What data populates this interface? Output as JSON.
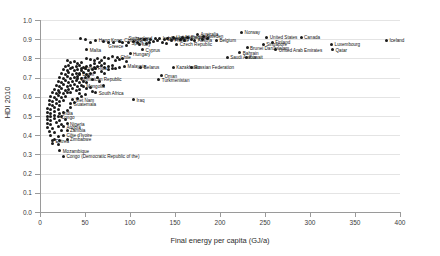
{
  "chart_data": {
    "type": "scatter",
    "title": "",
    "xlabel": "Final energy per capita (GJ/a)",
    "ylabel": "HDI 2010",
    "xlim": [
      0,
      400
    ],
    "ylim": [
      0.0,
      1.0
    ],
    "xticks": [
      "0",
      "50",
      "100",
      "150",
      "200",
      "250",
      "300",
      "350",
      "400"
    ],
    "yticks": [
      "0.0",
      "0.1",
      "0.2",
      "0.3",
      "0.4",
      "0.5",
      "0.6",
      "0.7",
      "0.8",
      "0.9",
      "1.0"
    ],
    "grid": "horizontal",
    "legend": "none",
    "marker_color": "#1a1a1a",
    "points": [
      {
        "label": "Iceland",
        "x": 385,
        "y": 0.895,
        "side": "right"
      },
      {
        "label": "Norway",
        "x": 224,
        "y": 0.935,
        "side": "right"
      },
      {
        "label": "Australia",
        "x": 175,
        "y": 0.925,
        "side": "right"
      },
      {
        "label": "United States",
        "x": 252,
        "y": 0.91,
        "side": "right"
      },
      {
        "label": "Canada",
        "x": 290,
        "y": 0.91,
        "side": "right"
      },
      {
        "label": "Luxembourg",
        "x": 324,
        "y": 0.875,
        "side": "right"
      },
      {
        "label": "Qatar",
        "x": 325,
        "y": 0.845,
        "side": "right"
      },
      {
        "label": "United Arab Emirates",
        "x": 262,
        "y": 0.845,
        "side": "right"
      },
      {
        "label": "Finland",
        "x": 258,
        "y": 0.885,
        "side": "right"
      },
      {
        "label": "Singapore",
        "x": 248,
        "y": 0.875,
        "side": "right"
      },
      {
        "label": "Brunei Darussalam",
        "x": 230,
        "y": 0.855,
        "side": "right"
      },
      {
        "label": "Bahrain",
        "x": 222,
        "y": 0.83,
        "side": "right"
      },
      {
        "label": "Saudi Arabia",
        "x": 208,
        "y": 0.805,
        "side": "right"
      },
      {
        "label": "Kuwait",
        "x": 229,
        "y": 0.805,
        "side": "right"
      },
      {
        "label": "Sweden",
        "x": 182,
        "y": 0.915,
        "side": "right"
      },
      {
        "label": "Belgium",
        "x": 196,
        "y": 0.895,
        "side": "right"
      },
      {
        "label": "Austria",
        "x": 172,
        "y": 0.895,
        "side": "right"
      },
      {
        "label": "United Kingdom",
        "x": 148,
        "y": 0.91,
        "side": "right"
      },
      {
        "label": "France",
        "x": 146,
        "y": 0.895,
        "side": "right"
      },
      {
        "label": "Czech Republic",
        "x": 152,
        "y": 0.875,
        "side": "right"
      },
      {
        "label": "Germany",
        "x": 142,
        "y": 0.905,
        "side": "right"
      },
      {
        "label": "Netherlands",
        "x": 158,
        "y": 0.91,
        "side": "right"
      },
      {
        "label": "Denmark",
        "x": 138,
        "y": 0.9,
        "side": "right"
      },
      {
        "label": "Ireland",
        "x": 133,
        "y": 0.905,
        "side": "right"
      },
      {
        "label": "Switzerland",
        "x": 128,
        "y": 0.905,
        "side": "left"
      },
      {
        "label": "Japan",
        "x": 123,
        "y": 0.9,
        "side": "left"
      },
      {
        "label": "Spain",
        "x": 118,
        "y": 0.88,
        "side": "left"
      },
      {
        "label": "Italy",
        "x": 110,
        "y": 0.875,
        "side": "right"
      },
      {
        "label": "Greece",
        "x": 96,
        "y": 0.865,
        "side": "left"
      },
      {
        "label": "Cyprus",
        "x": 114,
        "y": 0.845,
        "side": "right"
      },
      {
        "label": "Hungary",
        "x": 100,
        "y": 0.825,
        "side": "right"
      },
      {
        "label": "Chile",
        "x": 86,
        "y": 0.805,
        "side": "right"
      },
      {
        "label": "Hong Kong, China (SAR)",
        "x": 62,
        "y": 0.895,
        "side": "right"
      },
      {
        "label": "Malta",
        "x": 52,
        "y": 0.845,
        "side": "right"
      },
      {
        "label": "Malaysia",
        "x": 94,
        "y": 0.76,
        "side": "right"
      },
      {
        "label": "Belarus",
        "x": 112,
        "y": 0.755,
        "side": "right"
      },
      {
        "label": "Kazakhstan",
        "x": 148,
        "y": 0.755,
        "side": "right"
      },
      {
        "label": "Russian Federation",
        "x": 168,
        "y": 0.755,
        "side": "right"
      },
      {
        "label": "Oman",
        "x": 135,
        "y": 0.71,
        "side": "right"
      },
      {
        "label": "Turkmenistan",
        "x": 132,
        "y": 0.69,
        "side": "right"
      },
      {
        "label": "Iraq",
        "x": 104,
        "y": 0.585,
        "side": "right"
      },
      {
        "label": "Costa Rica",
        "x": 46,
        "y": 0.75,
        "side": "right"
      },
      {
        "label": "Brazil",
        "x": 44,
        "y": 0.72,
        "side": "right"
      },
      {
        "label": "Dominican Republic",
        "x": 42,
        "y": 0.695,
        "side": "right"
      },
      {
        "label": "Mongolia",
        "x": 48,
        "y": 0.655,
        "side": "right"
      },
      {
        "label": "South Africa",
        "x": 62,
        "y": 0.62,
        "side": "right"
      },
      {
        "label": "Viet Nam",
        "x": 36,
        "y": 0.585,
        "side": "right"
      },
      {
        "label": "Guatemala",
        "x": 34,
        "y": 0.565,
        "side": "right"
      },
      {
        "label": "India",
        "x": 22,
        "y": 0.515,
        "side": "right"
      },
      {
        "label": "Congo",
        "x": 20,
        "y": 0.495,
        "side": "right"
      },
      {
        "label": "Nigeria",
        "x": 30,
        "y": 0.46,
        "side": "right"
      },
      {
        "label": "Angola",
        "x": 26,
        "y": 0.445,
        "side": "right"
      },
      {
        "label": "Zambia",
        "x": 30,
        "y": 0.425,
        "side": "right"
      },
      {
        "label": "Côte d'Ivoire",
        "x": 26,
        "y": 0.4,
        "side": "right"
      },
      {
        "label": "Zimbabwe",
        "x": 30,
        "y": 0.38,
        "side": "right"
      },
      {
        "label": "Eritrea",
        "x": 14,
        "y": 0.37,
        "side": "right"
      },
      {
        "label": "Mozambique",
        "x": 22,
        "y": 0.32,
        "side": "right"
      },
      {
        "label": "Congo (Democratic Republic of the)",
        "x": 26,
        "y": 0.29,
        "side": "right"
      }
    ],
    "unlabeled_points": [
      [
        45,
        0.905
      ],
      [
        50,
        0.9
      ],
      [
        56,
        0.885
      ],
      [
        70,
        0.89
      ],
      [
        76,
        0.885
      ],
      [
        82,
        0.885
      ],
      [
        88,
        0.89
      ],
      [
        92,
        0.885
      ],
      [
        98,
        0.885
      ],
      [
        104,
        0.89
      ],
      [
        108,
        0.885
      ],
      [
        116,
        0.9
      ],
      [
        122,
        0.885
      ],
      [
        126,
        0.89
      ],
      [
        130,
        0.895
      ],
      [
        136,
        0.885
      ],
      [
        140,
        0.88
      ],
      [
        156,
        0.9
      ],
      [
        160,
        0.895
      ],
      [
        164,
        0.91
      ],
      [
        168,
        0.9
      ],
      [
        180,
        0.9
      ],
      [
        186,
        0.905
      ],
      [
        52,
        0.8
      ],
      [
        56,
        0.795
      ],
      [
        60,
        0.79
      ],
      [
        64,
        0.8
      ],
      [
        68,
        0.79
      ],
      [
        72,
        0.805
      ],
      [
        76,
        0.8
      ],
      [
        80,
        0.81
      ],
      [
        84,
        0.79
      ],
      [
        88,
        0.795
      ],
      [
        92,
        0.8
      ],
      [
        96,
        0.785
      ],
      [
        72,
        0.775
      ],
      [
        66,
        0.78
      ],
      [
        60,
        0.775
      ],
      [
        30,
        0.79
      ],
      [
        34,
        0.78
      ],
      [
        38,
        0.785
      ],
      [
        42,
        0.775
      ],
      [
        46,
        0.78
      ],
      [
        28,
        0.76
      ],
      [
        32,
        0.765
      ],
      [
        36,
        0.755
      ],
      [
        40,
        0.76
      ],
      [
        44,
        0.765
      ],
      [
        48,
        0.755
      ],
      [
        52,
        0.76
      ],
      [
        56,
        0.765
      ],
      [
        60,
        0.755
      ],
      [
        64,
        0.76
      ],
      [
        68,
        0.765
      ],
      [
        72,
        0.755
      ],
      [
        76,
        0.76
      ],
      [
        80,
        0.765
      ],
      [
        26,
        0.74
      ],
      [
        30,
        0.735
      ],
      [
        34,
        0.745
      ],
      [
        38,
        0.735
      ],
      [
        42,
        0.74
      ],
      [
        46,
        0.735
      ],
      [
        50,
        0.745
      ],
      [
        54,
        0.735
      ],
      [
        58,
        0.74
      ],
      [
        62,
        0.745
      ],
      [
        24,
        0.72
      ],
      [
        28,
        0.715
      ],
      [
        32,
        0.725
      ],
      [
        36,
        0.715
      ],
      [
        40,
        0.72
      ],
      [
        44,
        0.715
      ],
      [
        48,
        0.725
      ],
      [
        52,
        0.715
      ],
      [
        56,
        0.72
      ],
      [
        60,
        0.725
      ],
      [
        22,
        0.7
      ],
      [
        26,
        0.695
      ],
      [
        30,
        0.705
      ],
      [
        34,
        0.695
      ],
      [
        38,
        0.7
      ],
      [
        42,
        0.705
      ],
      [
        46,
        0.695
      ],
      [
        50,
        0.7
      ],
      [
        54,
        0.705
      ],
      [
        58,
        0.69
      ],
      [
        20,
        0.68
      ],
      [
        24,
        0.675
      ],
      [
        28,
        0.685
      ],
      [
        32,
        0.675
      ],
      [
        36,
        0.68
      ],
      [
        40,
        0.685
      ],
      [
        44,
        0.675
      ],
      [
        48,
        0.68
      ],
      [
        52,
        0.675
      ],
      [
        18,
        0.66
      ],
      [
        22,
        0.655
      ],
      [
        26,
        0.665
      ],
      [
        30,
        0.655
      ],
      [
        34,
        0.66
      ],
      [
        38,
        0.665
      ],
      [
        42,
        0.655
      ],
      [
        46,
        0.66
      ],
      [
        16,
        0.64
      ],
      [
        20,
        0.635
      ],
      [
        24,
        0.645
      ],
      [
        28,
        0.635
      ],
      [
        32,
        0.64
      ],
      [
        36,
        0.645
      ],
      [
        40,
        0.635
      ],
      [
        44,
        0.64
      ],
      [
        14,
        0.62
      ],
      [
        18,
        0.615
      ],
      [
        22,
        0.625
      ],
      [
        26,
        0.615
      ],
      [
        30,
        0.62
      ],
      [
        34,
        0.625
      ],
      [
        44,
        0.615
      ],
      [
        12,
        0.6
      ],
      [
        16,
        0.595
      ],
      [
        20,
        0.605
      ],
      [
        24,
        0.595
      ],
      [
        28,
        0.6
      ],
      [
        10,
        0.58
      ],
      [
        14,
        0.575
      ],
      [
        18,
        0.585
      ],
      [
        22,
        0.575
      ],
      [
        26,
        0.58
      ],
      [
        10,
        0.56
      ],
      [
        14,
        0.555
      ],
      [
        18,
        0.565
      ],
      [
        22,
        0.555
      ],
      [
        8,
        0.54
      ],
      [
        12,
        0.535
      ],
      [
        16,
        0.545
      ],
      [
        20,
        0.535
      ],
      [
        8,
        0.52
      ],
      [
        12,
        0.515
      ],
      [
        16,
        0.525
      ],
      [
        26,
        0.52
      ],
      [
        8,
        0.5
      ],
      [
        12,
        0.495
      ],
      [
        16,
        0.505
      ],
      [
        24,
        0.5
      ],
      [
        8,
        0.48
      ],
      [
        12,
        0.475
      ],
      [
        16,
        0.485
      ],
      [
        22,
        0.475
      ],
      [
        28,
        0.48
      ],
      [
        8,
        0.46
      ],
      [
        12,
        0.455
      ],
      [
        18,
        0.465
      ],
      [
        24,
        0.455
      ],
      [
        8,
        0.44
      ],
      [
        14,
        0.435
      ],
      [
        20,
        0.445
      ],
      [
        10,
        0.42
      ],
      [
        16,
        0.415
      ],
      [
        24,
        0.425
      ],
      [
        12,
        0.4
      ],
      [
        20,
        0.395
      ],
      [
        16,
        0.38
      ],
      [
        22,
        0.375
      ],
      [
        14,
        0.355
      ],
      [
        20,
        0.35
      ],
      [
        88,
        0.755
      ],
      [
        84,
        0.75
      ],
      [
        80,
        0.745
      ],
      [
        76,
        0.74
      ],
      [
        68,
        0.73
      ],
      [
        72,
        0.72
      ],
      [
        64,
        0.7
      ],
      [
        66,
        0.68
      ],
      [
        70,
        0.66
      ],
      [
        56,
        0.65
      ],
      [
        52,
        0.645
      ],
      [
        58,
        0.63
      ],
      [
        50,
        0.61
      ],
      [
        46,
        0.6
      ],
      [
        42,
        0.59
      ],
      [
        38,
        0.57
      ],
      [
        34,
        0.545
      ],
      [
        30,
        0.53
      ]
    ]
  }
}
